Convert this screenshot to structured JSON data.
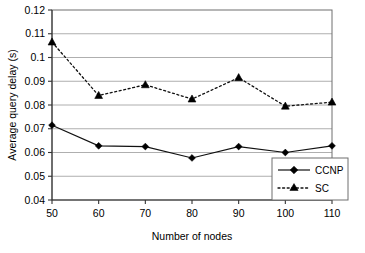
{
  "chart_data": {
    "type": "line",
    "title": "",
    "xlabel": "Number of nodes",
    "ylabel": "Average query delay (s)",
    "x": [
      50,
      60,
      70,
      80,
      90,
      100,
      110
    ],
    "xlim": [
      50,
      110
    ],
    "ylim": [
      0.04,
      0.12
    ],
    "xticks": [
      "50",
      "60",
      "70",
      "80",
      "90",
      "100",
      "110"
    ],
    "yticks": [
      "0.04",
      "0.05",
      "0.06",
      "0.07",
      "0.08",
      "0.09",
      "0.1",
      "0.11",
      "0.12"
    ],
    "grid": "horizontal",
    "legend_position": "bottom-right",
    "series": [
      {
        "name": "CCNP",
        "marker": "diamond",
        "linestyle": "solid",
        "color": "#000000",
        "values": [
          0.0715,
          0.0628,
          0.0625,
          0.0577,
          0.0625,
          0.06,
          0.0628
        ]
      },
      {
        "name": "SC",
        "marker": "triangle",
        "linestyle": "dotted",
        "color": "#000000",
        "values": [
          0.1065,
          0.084,
          0.0885,
          0.0825,
          0.0915,
          0.0795,
          0.0812
        ]
      }
    ]
  },
  "legend": {
    "entries": [
      {
        "label": "CCNP"
      },
      {
        "label": "SC"
      }
    ]
  }
}
